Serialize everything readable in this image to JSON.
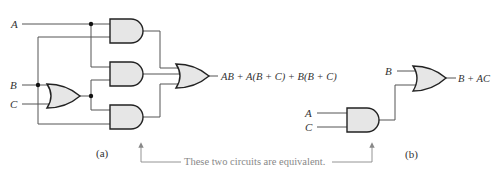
{
  "circuit_a": {
    "caption": "(a)",
    "inputs": {
      "a": "A",
      "b": "B",
      "c": "C"
    },
    "output_expression": "AB + A(B + C) + B(B + C)",
    "gates": [
      "AND",
      "AND",
      "AND",
      "OR",
      "OR"
    ]
  },
  "circuit_b": {
    "caption": "(b)",
    "inputs": {
      "b": "B",
      "a": "A",
      "c": "C"
    },
    "output_expression": "B + AC",
    "gates": [
      "AND",
      "OR"
    ]
  },
  "annotation": {
    "text": "These two circuits are equivalent."
  }
}
